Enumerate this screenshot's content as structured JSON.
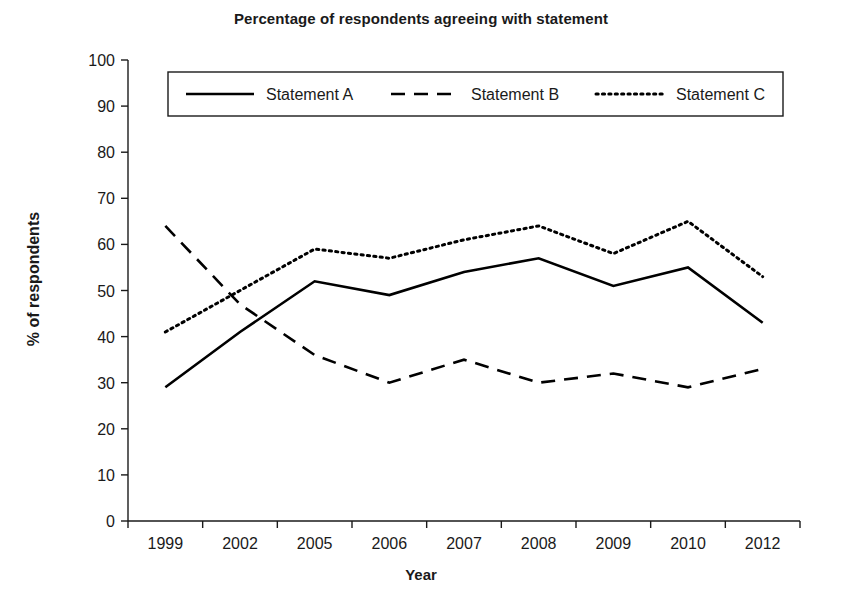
{
  "chart_data": {
    "type": "line",
    "title": "Percentage of respondents agreeing with statement",
    "xlabel": "Year",
    "ylabel": "% of respondents",
    "categories": [
      "1999",
      "2002",
      "2005",
      "2006",
      "2007",
      "2008",
      "2009",
      "2010",
      "2012"
    ],
    "series": [
      {
        "name": "Statement A",
        "style": "solid",
        "values": [
          29,
          41,
          52,
          49,
          54,
          57,
          51,
          55,
          43
        ]
      },
      {
        "name": "Statement B",
        "style": "dashed",
        "values": [
          64,
          47,
          36,
          30,
          35,
          30,
          32,
          29,
          33
        ]
      },
      {
        "name": "Statement C",
        "style": "dotted",
        "values": [
          41,
          50,
          59,
          57,
          61,
          64,
          58,
          65,
          53
        ]
      }
    ],
    "ylim": [
      0,
      100
    ],
    "ytick_step": 10,
    "yticks": [
      "0",
      "10",
      "20",
      "30",
      "40",
      "50",
      "60",
      "70",
      "80",
      "90",
      "100"
    ],
    "grid": false,
    "legend_position": "top-inside",
    "line_color": "#000000",
    "background_color": "#ffffff"
  }
}
